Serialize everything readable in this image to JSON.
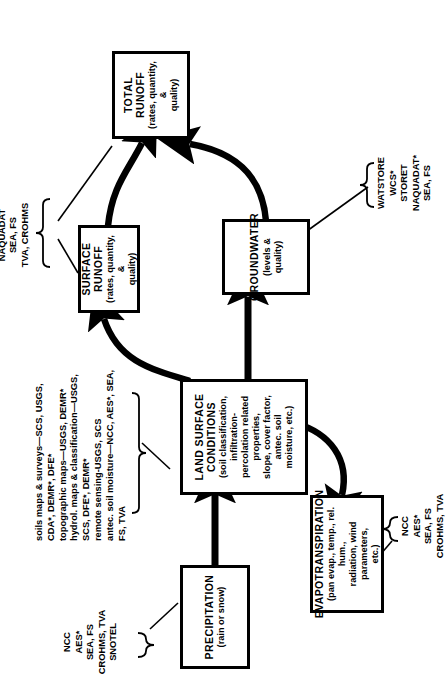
{
  "figure": {
    "type": "flowchart",
    "orientation": "rotated-90-ccw",
    "nodes": [
      {
        "id": "precipitation",
        "title": "PRECIPITATION",
        "sub": "(rain or snow)"
      },
      {
        "id": "land-surface-conditions",
        "title": "LAND SURFACE CONDITIONS",
        "sub": "(soil classification, infiltration-\npercolation related properties,\nslope, cover factor, antec. soil\nmoisture, etc.)"
      },
      {
        "id": "evapotranspiration",
        "title": "EVAPOTRANSPIRATION",
        "sub": "(pan evap., temp., rel. hum.,\nradiation, wind parameters,\netc.)"
      },
      {
        "id": "surface-runoff",
        "title": "SURFACE RUNOFF",
        "sub": "(rates, quantity, &\nquality)"
      },
      {
        "id": "groundwater",
        "title": "GROUNDWATER",
        "sub": "(levels & quality)"
      },
      {
        "id": "total-runoff",
        "title": "TOTAL RUNOFF",
        "sub": "(rates, quantity, &\nquality)"
      }
    ],
    "sources": {
      "precipitation_sources": "NCC\nAES*\nSEA, FS\nCROHMS, TVA\nSNOTEL",
      "land_surface_sources": "soils maps & surveys—SCS, USGS,\nCDA*, DEMR*, DFE*\ntopographic maps—USGS, DEMR*\nhydrol. maps & classification—USGS,\nSCS, DFE*, DEMR*\nremote sensing-USGS, SCS\nantec. soil moisture—NCC, AES*, SEA,\nFS, TVA",
      "evapotranspiration_sources": "NCC\nAES*\nSEA, FS\nCROHMS, TVA",
      "runoff_sources": "WATSTORE\nWSC*\nSTORET\nNAQUADAT\nSEA, FS\nTVA, CROHMS",
      "groundwater_sources": "WATSTORE\nWCS*\nSTORET\nNAQUADAT*\nSEA, FS"
    },
    "flows": [
      {
        "from": "precipitation",
        "to": "land-surface-conditions",
        "style": "straight"
      },
      {
        "from": "land-surface-conditions",
        "to": "surface-runoff",
        "style": "curved"
      },
      {
        "from": "land-surface-conditions",
        "to": "groundwater",
        "style": "straight"
      },
      {
        "from": "land-surface-conditions",
        "to": "evapotranspiration",
        "style": "curved"
      },
      {
        "from": "surface-runoff",
        "to": "total-runoff",
        "style": "curved"
      },
      {
        "from": "groundwater",
        "to": "total-runoff",
        "style": "curved"
      }
    ],
    "colors": {
      "ink": "#000000",
      "paper": "#ffffff"
    }
  }
}
